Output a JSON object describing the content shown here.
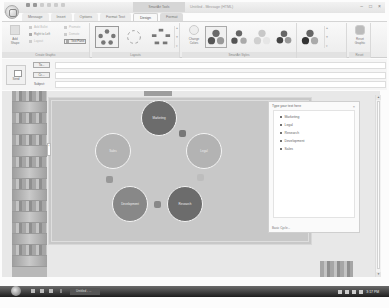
{
  "window": {
    "title": "Untitled - Message (HTML)",
    "contextual_tab_group": "SmartArt Tools",
    "controls": [
      "minimize",
      "maximize",
      "close"
    ]
  },
  "quick_access_toolbar": [
    "save-icon",
    "undo-icon",
    "redo-icon",
    "up-icon",
    "down-icon",
    "customize-icon"
  ],
  "tabs": [
    {
      "label": "Message",
      "active": false
    },
    {
      "label": "Insert",
      "active": false
    },
    {
      "label": "Options",
      "active": false
    },
    {
      "label": "Format Text",
      "active": false
    },
    {
      "label": "Design",
      "active": true,
      "contextual": true
    },
    {
      "label": "Format",
      "active": false,
      "contextual": true
    }
  ],
  "ribbon": {
    "create_graphic": {
      "label": "Create Graphic",
      "add_shape": "Add Shape",
      "add_bullet": "Add Bullet",
      "right_to_left": "Right to Left",
      "layout": "Layout",
      "promote": "Promote",
      "demote": "Demote",
      "text_pane": "Text Pane"
    },
    "layouts": {
      "label": "Layouts",
      "items": [
        "Basic Cycle",
        "Text Cycle",
        "Block Cycle"
      ]
    },
    "smartart_styles": {
      "label": "SmartArt Styles",
      "change_colors": "Change Colors",
      "items": [
        "Style 1",
        "Style 2",
        "Style 3",
        "Style 4",
        "Style 5"
      ]
    },
    "reset": {
      "label": "Reset",
      "reset_graphic": "Reset Graphic"
    }
  },
  "message": {
    "send": "Send",
    "to_button": "To...",
    "cc_button": "Cc...",
    "subject_label": "Subject:",
    "to_value": "",
    "cc_value": "",
    "subject_value": ""
  },
  "diagram": {
    "type": "Basic Cycle",
    "nodes": [
      {
        "label": "Marketing",
        "shade": "dark"
      },
      {
        "label": "Legal",
        "shade": "light"
      },
      {
        "label": "Research",
        "shade": "dark"
      },
      {
        "label": "Development",
        "shade": "mid"
      },
      {
        "label": "Sales",
        "shade": "light"
      }
    ]
  },
  "text_pane": {
    "title": "Type your text here",
    "close": "×",
    "items": [
      "Marketing",
      "Legal",
      "Research",
      "Development",
      "Sales"
    ],
    "footer": "Basic Cycle..."
  },
  "taskbar": {
    "task_label": "Untitled - ...",
    "clock": "3:17 PM"
  }
}
